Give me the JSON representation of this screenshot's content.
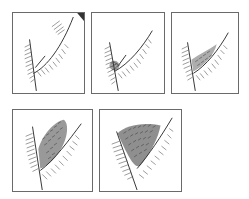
{
  "figure": {
    "panels": [
      {
        "id": 1,
        "stage": 1,
        "density": "none"
      },
      {
        "id": 2,
        "stage": 2,
        "density": "sparse"
      },
      {
        "id": 3,
        "stage": 3,
        "density": "light"
      },
      {
        "id": 4,
        "stage": 4,
        "density": "moderate"
      },
      {
        "id": 5,
        "stage": 5,
        "density": "dense"
      }
    ],
    "colors": {
      "line": "#333333",
      "border": "#6a6a6a",
      "background": "#ffffff"
    }
  }
}
